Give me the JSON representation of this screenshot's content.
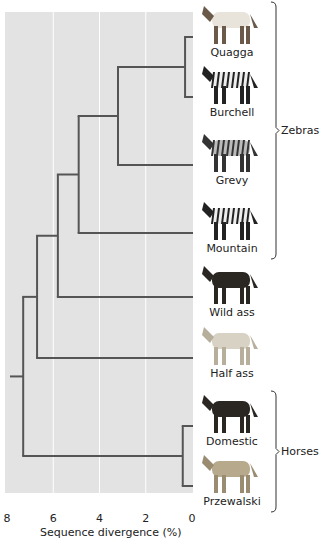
{
  "chart_data": {
    "type": "dendrogram",
    "title": "",
    "xlabel": "Sequence divergence (%)",
    "x_ticks": [
      "8",
      "6",
      "4",
      "2",
      "0"
    ],
    "xlim": [
      8,
      0
    ],
    "grid": true,
    "leaves": [
      {
        "name": "Quagga",
        "group": "Zebras",
        "coat": "quagga"
      },
      {
        "name": "Burchell",
        "group": "Zebras",
        "coat": "zebra"
      },
      {
        "name": "Grevy",
        "group": "Zebras",
        "coat": "zebra-dark"
      },
      {
        "name": "Mountain",
        "group": "Zebras",
        "coat": "zebra"
      },
      {
        "name": "Wild ass",
        "group": "",
        "coat": "dark"
      },
      {
        "name": "Half ass",
        "group": "",
        "coat": "light"
      },
      {
        "name": "Domestic",
        "group": "Horses",
        "coat": "dark"
      },
      {
        "name": "Przewalski",
        "group": "Horses",
        "coat": "tan"
      }
    ],
    "nodes": [
      {
        "id": "n1",
        "children": [
          0,
          1
        ],
        "divergence": 0.3
      },
      {
        "id": "n2",
        "children": [
          "n1",
          2
        ],
        "divergence": 3.2
      },
      {
        "id": "n3",
        "children": [
          "n2",
          3
        ],
        "divergence": 4.9
      },
      {
        "id": "n4",
        "children": [
          "n3",
          4
        ],
        "divergence": 5.8
      },
      {
        "id": "n5",
        "children": [
          "n4",
          5
        ],
        "divergence": 6.7
      },
      {
        "id": "n6",
        "children": [
          6,
          7
        ],
        "divergence": 0.4
      },
      {
        "id": "root",
        "children": [
          "n5",
          "n6"
        ],
        "divergence": 7.3
      }
    ],
    "groups": [
      {
        "label": "Zebras",
        "from": 0,
        "to": 3
      },
      {
        "label": "Horses",
        "from": 6,
        "to": 7
      }
    ]
  },
  "colors": {
    "plot_bg": "#e3e3e3",
    "branch": "#555555",
    "grid": "#ffffff"
  }
}
